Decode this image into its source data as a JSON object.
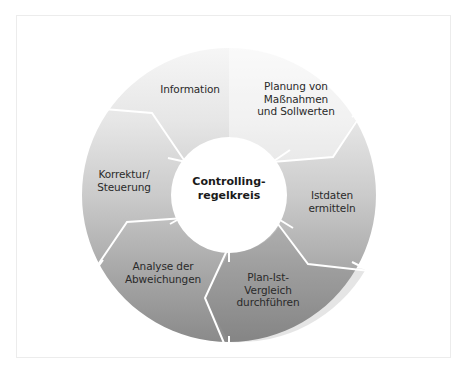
{
  "diagram": {
    "type": "cycle",
    "center": {
      "label": "Controlling-\nregelkreis"
    },
    "segments": [
      {
        "id": "information",
        "label": "Information"
      },
      {
        "id": "planung",
        "label": "Planung von\nMaßnahmen\nund Sollwerten"
      },
      {
        "id": "istdaten",
        "label": "Istdaten\nermitteln"
      },
      {
        "id": "plan-ist",
        "label": "Plan-Ist-\nVergleich\ndurchführen"
      },
      {
        "id": "analyse",
        "label": "Analyse der\nAbweichungen"
      },
      {
        "id": "korrektur",
        "label": "Korrektur/\nSteuerung"
      }
    ],
    "colors": {
      "ring_light": "#f4f4f4",
      "ring_mid": "#c6c6c6",
      "ring_dark": "#8e8e8e",
      "separator": "#ffffff",
      "text": "#2a2a2a"
    }
  }
}
